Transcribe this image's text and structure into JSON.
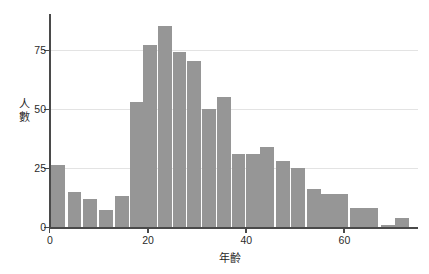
{
  "chart_data": {
    "type": "bar",
    "title": "",
    "subtitle": "",
    "xlabel": "年齡",
    "ylabel": "人數",
    "xlim": [
      0,
      75
    ],
    "ylim": [
      0,
      90
    ],
    "x_ticks": [
      0,
      20,
      40,
      60
    ],
    "x_tick_labels": [
      "0",
      "20",
      "40",
      "60"
    ],
    "y_ticks": [
      0,
      25,
      50,
      75
    ],
    "y_tick_labels": [
      "0",
      "25",
      "50",
      "75"
    ],
    "grid": "horizontal",
    "legend": "none",
    "bar_color": "#969696",
    "axis_color": "#4a4a4a",
    "grid_color": "#e3e3e3",
    "bin_width": 3.1,
    "bin_starts": [
      0.3,
      3.6,
      6.8,
      10.0,
      13.2,
      16.4,
      19.0,
      22.0,
      25.0,
      28.0,
      31.0,
      34.0,
      37.0,
      40.0,
      42.8,
      46.0,
      49.2,
      52.4,
      55.2,
      58.0,
      61.2,
      64.0,
      67.5,
      70.4
    ],
    "categories": [
      "0-3",
      "4-7",
      "7-10",
      "10-13",
      "13-16",
      "16-19",
      "19-22",
      "22-25",
      "25-28",
      "28-31",
      "31-34",
      "34-37",
      "37-40",
      "40-43",
      "43-46",
      "46-49",
      "49-52",
      "52-55",
      "55-58",
      "58-61",
      "61-64",
      "64-67",
      "67-70",
      "70-73"
    ],
    "values": [
      26,
      15,
      12,
      7,
      13,
      53,
      77,
      85,
      74,
      70,
      50,
      55,
      31,
      31,
      34,
      28,
      25,
      16,
      14,
      14,
      8,
      8,
      1,
      4
    ]
  }
}
